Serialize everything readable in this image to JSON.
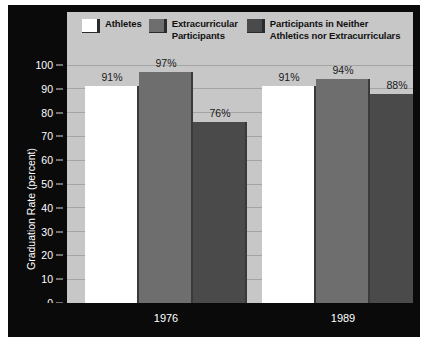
{
  "chart_data": {
    "type": "bar",
    "title": "",
    "subtitle": "",
    "xlabel": "",
    "ylabel": "Graduation Rate (percent)",
    "categories": [
      "1976",
      "1989"
    ],
    "series": [
      {
        "name": "Athletes",
        "color": "#ffffff",
        "values": [
          91,
          91
        ],
        "labels": [
          "91%",
          "91%"
        ]
      },
      {
        "name": "Extracurricular Participants",
        "color": "#6e6e6e",
        "values": [
          97,
          94
        ],
        "labels": [
          "97%",
          "94%"
        ]
      },
      {
        "name": "Participants in Neither Athletics nor Extracurriculars",
        "color": "#4a4a4a",
        "values": [
          76,
          88
        ],
        "labels": [
          "76%",
          "88%"
        ]
      }
    ],
    "ylim": [
      0,
      100
    ],
    "ytick_values": [
      0,
      10,
      20,
      30,
      40,
      50,
      60,
      70,
      80,
      90,
      100
    ],
    "ytick_labels": [
      "0",
      "10",
      "20",
      "30",
      "40",
      "50",
      "60",
      "70",
      "80",
      "90",
      "100"
    ],
    "grid": true,
    "legend_position": "top",
    "plot_background": "#c7c7c7",
    "axis_background": "#0a0a0a",
    "axis_text_color": "#ffffff"
  },
  "legend": {
    "items": [
      {
        "label": "Athletes",
        "color": "#ffffff"
      },
      {
        "label": "Extracurricular\nParticipants",
        "color": "#6e6e6e"
      },
      {
        "label": "Participants in Neither\nAthletics nor Extracurriculars",
        "color": "#4a4a4a"
      }
    ]
  }
}
